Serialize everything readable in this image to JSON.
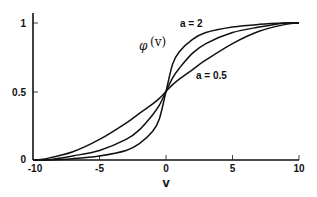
{
  "chart_data": {
    "type": "line",
    "title": "",
    "xlabel": "v",
    "ylabel": "",
    "function_label": "φ(v)",
    "xlim": [
      -10,
      10
    ],
    "ylim": [
      0,
      1
    ],
    "grid": false,
    "legend": "none (inline annotations)",
    "x_ticks": [
      "-10",
      "-5",
      "0",
      "5",
      "10"
    ],
    "y_ticks": [
      "0",
      "0.5",
      "1"
    ],
    "annotations": [
      {
        "text": "a = 2",
        "points_to": "steepest curve"
      },
      {
        "text": "a = 0.5",
        "points_to": "flattest curve"
      }
    ],
    "x": [
      -10,
      -9,
      -7,
      -5,
      -3,
      -2,
      -1,
      -0.5,
      0,
      0.5,
      1,
      2,
      3,
      5,
      7,
      9,
      10
    ],
    "series": [
      {
        "name": "a = 2",
        "values": [
          0.0,
          0.0,
          0.01,
          0.03,
          0.07,
          0.12,
          0.21,
          0.3,
          0.5,
          0.7,
          0.79,
          0.88,
          0.93,
          0.97,
          0.99,
          1.0,
          1.0
        ]
      },
      {
        "name": "a = 1",
        "values": [
          0.0,
          0.0,
          0.03,
          0.07,
          0.15,
          0.22,
          0.33,
          0.4,
          0.5,
          0.6,
          0.67,
          0.78,
          0.85,
          0.93,
          0.97,
          1.0,
          1.0
        ]
      },
      {
        "name": "a = 0.5",
        "values": [
          0.0,
          0.01,
          0.06,
          0.15,
          0.27,
          0.34,
          0.41,
          0.45,
          0.5,
          0.55,
          0.59,
          0.66,
          0.73,
          0.85,
          0.94,
          0.99,
          1.0
        ]
      }
    ]
  },
  "labels": {
    "x_axis_title": "v",
    "phi_symbol": "φ",
    "phi_arg": "(v)",
    "annot_a2": "a = 2",
    "annot_a05": "a = 0.5",
    "x_ticks": [
      "-10",
      "-5",
      "0",
      "5",
      "10"
    ],
    "y_ticks": [
      "0",
      "0.5",
      "1"
    ]
  },
  "style": {
    "line_color": "#111111",
    "axis_color": "#111111",
    "background": "#ffffff"
  }
}
